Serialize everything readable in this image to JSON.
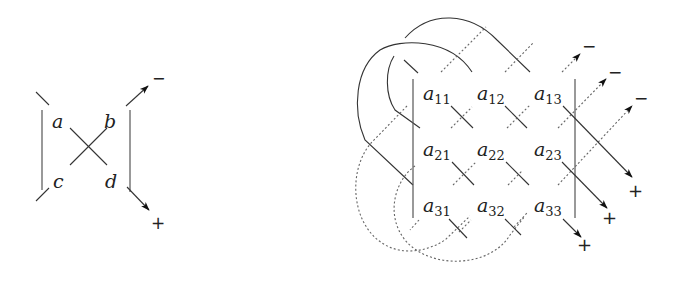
{
  "left_diagram": {
    "labels": {
      "a": "a",
      "b": "b",
      "c": "c",
      "d": "d"
    },
    "signs": {
      "top_right": "−",
      "bottom_right": "+"
    }
  },
  "right_diagram": {
    "matrix": [
      [
        {
          "base": "a",
          "sub": "11"
        },
        {
          "base": "a",
          "sub": "12"
        },
        {
          "base": "a",
          "sub": "13"
        }
      ],
      [
        {
          "base": "a",
          "sub": "21"
        },
        {
          "base": "a",
          "sub": "22"
        },
        {
          "base": "a",
          "sub": "23"
        }
      ],
      [
        {
          "base": "a",
          "sub": "31"
        },
        {
          "base": "a",
          "sub": "32"
        },
        {
          "base": "a",
          "sub": "33"
        }
      ]
    ],
    "signs": {
      "minus_1": "−",
      "minus_2": "−",
      "minus_3": "−",
      "plus_1": "+",
      "plus_2": "+",
      "plus_3": "+"
    }
  },
  "colors": {
    "stroke": "#333333",
    "dotted": "#666666",
    "background": "#ffffff"
  }
}
